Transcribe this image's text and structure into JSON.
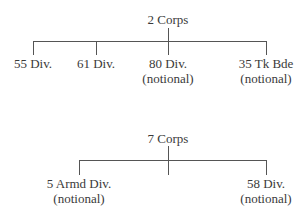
{
  "diagrams": [
    {
      "root": "2 Corps",
      "children": [
        {
          "name": "55 Div.",
          "note": ""
        },
        {
          "name": "61 Div.",
          "note": ""
        },
        {
          "name": "80 Div.",
          "note": "(notional)"
        },
        {
          "name": "35 Tk Bde",
          "note": "(notional)"
        }
      ]
    },
    {
      "root": "7 Corps",
      "children": [
        {
          "name": "5 Armd Div.",
          "note": "(notional)"
        },
        {
          "name": "58 Div.",
          "note": "(notional)"
        }
      ]
    }
  ]
}
